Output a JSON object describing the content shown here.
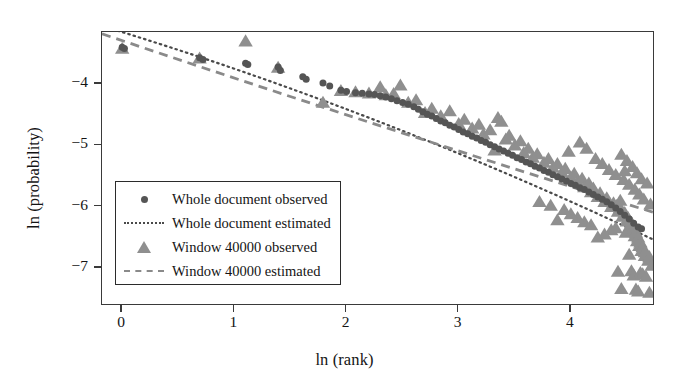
{
  "chart_data": {
    "type": "scatter",
    "title": "",
    "xlabel": "ln (rank)",
    "ylabel": "ln (probability)",
    "xlim": [
      -0.18,
      4.75
    ],
    "ylim": [
      -7.62,
      -3.15
    ],
    "xticks": [
      0,
      1,
      2,
      3,
      4
    ],
    "xticklabels": [
      "0",
      "1",
      "2",
      "3",
      "4"
    ],
    "yticks": [
      -4,
      -5,
      -6,
      -7
    ],
    "yticklabels": [
      "−4",
      "−5",
      "−6",
      "−7"
    ],
    "grid": false,
    "legend_position": "lower left",
    "colors": {
      "whole_document_observed": "#555555",
      "whole_document_estimated": "#4a4a4a",
      "window_observed": "#8f8f8f",
      "window_estimated": "#8a8a8a",
      "frame": "#3a3a3a",
      "background": "#ffffff"
    },
    "series": [
      {
        "name": "Whole document observed",
        "marker": "circle",
        "color": "#555555",
        "points": [
          [
            0.0,
            -3.4
          ],
          [
            0.02,
            -3.42
          ],
          [
            0.69,
            -3.57
          ],
          [
            0.72,
            -3.6
          ],
          [
            1.1,
            -3.66
          ],
          [
            1.12,
            -3.68
          ],
          [
            1.39,
            -3.72
          ],
          [
            1.41,
            -3.78
          ],
          [
            1.61,
            -3.88
          ],
          [
            1.64,
            -3.92
          ],
          [
            1.79,
            -3.98
          ],
          [
            1.85,
            -4.03
          ],
          [
            1.95,
            -4.1
          ],
          [
            2.0,
            -4.12
          ],
          [
            2.08,
            -4.14
          ],
          [
            2.14,
            -4.15
          ],
          [
            2.2,
            -4.16
          ],
          [
            2.25,
            -4.17
          ],
          [
            2.3,
            -4.19
          ],
          [
            2.35,
            -4.21
          ],
          [
            2.4,
            -4.24
          ],
          [
            2.45,
            -4.27
          ],
          [
            2.5,
            -4.3
          ],
          [
            2.55,
            -4.33
          ],
          [
            2.6,
            -4.37
          ],
          [
            2.64,
            -4.41
          ],
          [
            2.68,
            -4.45
          ],
          [
            2.72,
            -4.49
          ],
          [
            2.76,
            -4.52
          ],
          [
            2.8,
            -4.56
          ],
          [
            2.84,
            -4.6
          ],
          [
            2.88,
            -4.63
          ],
          [
            2.92,
            -4.67
          ],
          [
            2.96,
            -4.7
          ],
          [
            3.0,
            -4.74
          ],
          [
            3.04,
            -4.78
          ],
          [
            3.08,
            -4.81
          ],
          [
            3.12,
            -4.85
          ],
          [
            3.16,
            -4.88
          ],
          [
            3.2,
            -4.92
          ],
          [
            3.24,
            -4.95
          ],
          [
            3.28,
            -4.99
          ],
          [
            3.32,
            -5.02
          ],
          [
            3.36,
            -5.06
          ],
          [
            3.4,
            -5.09
          ],
          [
            3.44,
            -5.13
          ],
          [
            3.48,
            -5.16
          ],
          [
            3.52,
            -5.2
          ],
          [
            3.56,
            -5.23
          ],
          [
            3.6,
            -5.27
          ],
          [
            3.64,
            -5.3
          ],
          [
            3.68,
            -5.34
          ],
          [
            3.72,
            -5.37
          ],
          [
            3.76,
            -5.41
          ],
          [
            3.8,
            -5.44
          ],
          [
            3.84,
            -5.48
          ],
          [
            3.88,
            -5.51
          ],
          [
            3.92,
            -5.55
          ],
          [
            3.96,
            -5.58
          ],
          [
            4.0,
            -5.62
          ],
          [
            4.04,
            -5.65
          ],
          [
            4.08,
            -5.69
          ],
          [
            4.12,
            -5.72
          ],
          [
            4.16,
            -5.76
          ],
          [
            4.2,
            -5.8
          ],
          [
            4.24,
            -5.84
          ],
          [
            4.28,
            -5.88
          ],
          [
            4.32,
            -5.92
          ],
          [
            4.36,
            -5.97
          ],
          [
            4.4,
            -6.02
          ],
          [
            4.44,
            -6.08
          ],
          [
            4.48,
            -6.14
          ],
          [
            4.52,
            -6.2
          ],
          [
            4.56,
            -6.27
          ],
          [
            4.6,
            -6.33
          ],
          [
            4.63,
            -6.36
          ]
        ]
      },
      {
        "name": "Window 40000 observed",
        "marker": "triangle",
        "color": "#8f8f8f",
        "points": [
          [
            0.0,
            -3.42
          ],
          [
            0.69,
            -3.58
          ],
          [
            1.1,
            -3.3
          ],
          [
            1.39,
            -3.73
          ],
          [
            1.79,
            -4.3
          ],
          [
            1.95,
            -4.11
          ],
          [
            2.08,
            -4.13
          ],
          [
            2.2,
            -4.15
          ],
          [
            2.3,
            -4.05
          ],
          [
            2.35,
            -4.18
          ],
          [
            2.42,
            -4.16
          ],
          [
            2.48,
            -4.02
          ],
          [
            2.55,
            -4.3
          ],
          [
            2.62,
            -4.26
          ],
          [
            2.7,
            -4.47
          ],
          [
            2.76,
            -4.4
          ],
          [
            2.84,
            -4.52
          ],
          [
            2.92,
            -4.44
          ],
          [
            3.0,
            -4.65
          ],
          [
            3.05,
            -4.58
          ],
          [
            3.12,
            -4.72
          ],
          [
            3.18,
            -4.66
          ],
          [
            3.22,
            -4.82
          ],
          [
            3.28,
            -4.75
          ],
          [
            3.32,
            -5.08
          ],
          [
            3.35,
            -4.55
          ],
          [
            3.38,
            -4.61
          ],
          [
            3.42,
            -4.9
          ],
          [
            3.45,
            -4.84
          ],
          [
            3.5,
            -5.0
          ],
          [
            3.55,
            -4.93
          ],
          [
            3.58,
            -5.12
          ],
          [
            3.62,
            -5.05
          ],
          [
            3.66,
            -5.2
          ],
          [
            3.7,
            -5.14
          ],
          [
            3.72,
            -5.92
          ],
          [
            3.76,
            -5.28
          ],
          [
            3.8,
            -5.22
          ],
          [
            3.84,
            -5.36
          ],
          [
            3.88,
            -5.3
          ],
          [
            3.92,
            -5.44
          ],
          [
            3.95,
            -5.38
          ],
          [
            3.98,
            -5.1
          ],
          [
            4.0,
            -5.52
          ],
          [
            4.03,
            -5.46
          ],
          [
            4.06,
            -5.6
          ],
          [
            4.08,
            -4.95
          ],
          [
            4.1,
            -5.54
          ],
          [
            4.12,
            -5.68
          ],
          [
            4.14,
            -5.05
          ],
          [
            4.16,
            -5.62
          ],
          [
            4.18,
            -5.76
          ],
          [
            4.2,
            -5.7
          ],
          [
            4.22,
            -5.22
          ],
          [
            4.24,
            -5.84
          ],
          [
            4.26,
            -5.78
          ],
          [
            4.28,
            -5.3
          ],
          [
            4.3,
            -5.92
          ],
          [
            4.32,
            -5.86
          ],
          [
            4.34,
            -5.4
          ],
          [
            4.36,
            -6.0
          ],
          [
            4.38,
            -5.94
          ],
          [
            4.4,
            -5.48
          ],
          [
            4.42,
            -6.08
          ],
          [
            4.44,
            -6.02
          ],
          [
            4.45,
            -5.15
          ],
          [
            4.46,
            -6.16
          ],
          [
            4.47,
            -5.56
          ],
          [
            4.48,
            -6.1
          ],
          [
            4.49,
            -6.42
          ],
          [
            4.5,
            -5.25
          ],
          [
            4.5,
            -6.24
          ],
          [
            4.51,
            -6.18
          ],
          [
            4.52,
            -6.78
          ],
          [
            4.52,
            -5.64
          ],
          [
            4.53,
            -6.32
          ],
          [
            4.54,
            -6.26
          ],
          [
            4.54,
            -7.05
          ],
          [
            4.55,
            -5.35
          ],
          [
            4.55,
            -6.4
          ],
          [
            4.56,
            -6.34
          ],
          [
            4.56,
            -7.12
          ],
          [
            4.57,
            -5.72
          ],
          [
            4.57,
            -6.48
          ],
          [
            4.58,
            -6.42
          ],
          [
            4.58,
            -7.35
          ],
          [
            4.59,
            -5.45
          ],
          [
            4.59,
            -6.56
          ],
          [
            4.6,
            -6.5
          ],
          [
            4.6,
            -7.38
          ],
          [
            4.61,
            -5.8
          ],
          [
            4.61,
            -6.64
          ],
          [
            4.62,
            -6.58
          ],
          [
            4.62,
            -7.08
          ],
          [
            4.63,
            -5.55
          ],
          [
            4.63,
            -6.72
          ],
          [
            4.64,
            -6.66
          ],
          [
            4.64,
            -7.1
          ],
          [
            4.65,
            -5.88
          ],
          [
            4.66,
            -6.8
          ],
          [
            4.66,
            -6.74
          ],
          [
            4.67,
            -7.14
          ],
          [
            4.68,
            -5.62
          ],
          [
            4.69,
            -6.88
          ],
          [
            4.7,
            -6.82
          ],
          [
            4.7,
            -7.4
          ],
          [
            4.71,
            -5.96
          ],
          [
            4.72,
            -6.96
          ],
          [
            4.42,
            -7.06
          ],
          [
            4.45,
            -7.34
          ],
          [
            4.36,
            -6.38
          ],
          [
            4.3,
            -6.45
          ],
          [
            4.24,
            -6.5
          ],
          [
            4.18,
            -6.3
          ],
          [
            4.12,
            -6.25
          ],
          [
            4.06,
            -6.18
          ],
          [
            4.0,
            -6.12
          ],
          [
            3.94,
            -6.05
          ],
          [
            3.88,
            -6.22
          ],
          [
            3.82,
            -5.98
          ],
          [
            4.48,
            -5.42
          ],
          [
            4.44,
            -5.9
          ],
          [
            4.4,
            -6.35
          ]
        ]
      }
    ],
    "fit_lines": [
      {
        "name": "Whole document estimated",
        "style": "dotted",
        "color": "#4a4a4a",
        "from": [
          -0.18,
          -3.05
        ],
        "to": [
          4.75,
          -6.55
        ],
        "curve_control": [
          2.3,
          -4.62
        ]
      },
      {
        "name": "Window 40000 estimated",
        "style": "dashed",
        "color": "#8a8a8a",
        "from": [
          -0.18,
          -3.18
        ],
        "to": [
          4.75,
          -6.1
        ],
        "curve_control": [
          2.3,
          -4.68
        ]
      }
    ]
  },
  "axes": {
    "x_title": "ln (rank)",
    "y_title": "ln (probability)",
    "x_tick_labels": [
      "0",
      "1",
      "2",
      "3",
      "4"
    ],
    "y_tick_labels": [
      "−4",
      "−5",
      "−6",
      "−7"
    ]
  },
  "legend": {
    "entries": [
      {
        "key": "circle-marker",
        "label": "Whole document observed"
      },
      {
        "key": "dotted-line",
        "label": "Whole document estimated"
      },
      {
        "key": "triangle-marker",
        "label": "Window 40000 observed"
      },
      {
        "key": "dashed-line",
        "label": "Window 40000 estimated"
      }
    ]
  }
}
